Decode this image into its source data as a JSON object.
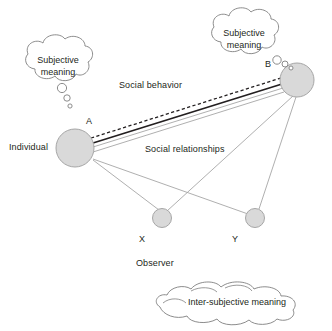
{
  "diagram": {
    "colors": {
      "node_fill": "#d9d9d9",
      "node_stroke": "#a6a6a6",
      "cloud_stroke": "#7f7f7f",
      "line_dark": "#231f20",
      "line_gray": "#a6a6a6",
      "text": "#231f20",
      "background": "#ffffff"
    },
    "nodes": [
      {
        "id": "A",
        "letter": "A",
        "label": "Individual",
        "cx": 75,
        "cy": 148,
        "r": 19
      },
      {
        "id": "B",
        "letter": "B",
        "label": "",
        "cx": 297,
        "cy": 80,
        "r": 17
      },
      {
        "id": "X",
        "letter": "X",
        "label": "",
        "cx": 162,
        "cy": 218,
        "r": 9.5
      },
      {
        "id": "Y",
        "letter": "Y",
        "label": "",
        "cx": 255,
        "cy": 218,
        "r": 9.5
      }
    ],
    "labels": {
      "individual": "Individual",
      "node_a": "A",
      "node_b": "B",
      "node_x": "X",
      "node_y": "Y",
      "observer": "Observer",
      "social_behavior": "Social behavior",
      "social_relationships": "Social relationships"
    },
    "clouds": [
      {
        "id": "left-subjective",
        "text": "Subjective\nmeaning"
      },
      {
        "id": "right-subjective",
        "text": "Subjective\nmeaning"
      },
      {
        "id": "intersubjective",
        "text": "Inter-subjective meaning"
      }
    ],
    "edges": [
      {
        "id": "social-behavior-dashed",
        "from": "A",
        "to": "B",
        "style": "dashed",
        "color": "#231f20"
      },
      {
        "id": "social-behavior-solid",
        "from": "A",
        "to": "B",
        "style": "solid-thick",
        "color": "#231f20"
      },
      {
        "id": "social-relationship-1",
        "from": "A",
        "to": "B",
        "style": "solid-thin",
        "color": "#a6a6a6"
      },
      {
        "id": "social-relationship-2",
        "from": "A",
        "to": "B",
        "style": "solid-thin",
        "color": "#a6a6a6"
      },
      {
        "id": "a-to-x",
        "from": "A",
        "to": "X",
        "style": "solid-thin",
        "color": "#a6a6a6"
      },
      {
        "id": "a-to-y",
        "from": "A",
        "to": "Y",
        "style": "solid-thin",
        "color": "#a6a6a6"
      },
      {
        "id": "b-to-x",
        "from": "B",
        "to": "X",
        "style": "solid-thin",
        "color": "#a6a6a6"
      },
      {
        "id": "b-to-y",
        "from": "B",
        "to": "Y",
        "style": "solid-thin",
        "color": "#a6a6a6"
      }
    ]
  }
}
